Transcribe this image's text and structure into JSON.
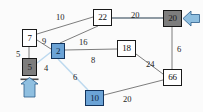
{
  "diagram": {
    "background_color": "#fbfbfb",
    "colors": {
      "node_white_fill": "#ffffff",
      "node_gray_fill": "#7d7d7d",
      "node_blue_fill": "#6ba3d6",
      "edge_default": "#6e6e6e",
      "edge_highlight": "#bcd9ef",
      "edge_thick": "#8e9aa3",
      "arrow_fill": "#8fbfe0",
      "arrow_stroke": "#2b5d8a",
      "text": "#1d1d1d"
    },
    "nodes": [
      {
        "id": "n7",
        "label": "7",
        "style": "white",
        "x": 22,
        "y": 29,
        "w": 15,
        "h": 18
      },
      {
        "id": "n5",
        "label": "5",
        "style": "gray",
        "x": 22,
        "y": 58,
        "w": 15,
        "h": 18
      },
      {
        "id": "n2",
        "label": "2",
        "style": "blue",
        "x": 51,
        "y": 43,
        "w": 14,
        "h": 16
      },
      {
        "id": "n22",
        "label": "22",
        "style": "white",
        "x": 93,
        "y": 9,
        "w": 19,
        "h": 17
      },
      {
        "id": "n20",
        "label": "20",
        "style": "gray",
        "x": 163,
        "y": 10,
        "w": 19,
        "h": 17
      },
      {
        "id": "n18",
        "label": "18",
        "style": "white",
        "x": 117,
        "y": 40,
        "w": 19,
        "h": 17
      },
      {
        "id": "n66",
        "label": "66",
        "style": "white",
        "x": 163,
        "y": 69,
        "w": 19,
        "h": 17
      },
      {
        "id": "n10",
        "label": "10",
        "style": "blue",
        "x": 85,
        "y": 90,
        "w": 19,
        "h": 16
      }
    ],
    "edges": [
      {
        "id": "e-7-22",
        "from": "n7",
        "to": "n22",
        "weight": "10",
        "style": "default",
        "label_x": 56,
        "label_y": 13
      },
      {
        "id": "e-7-2",
        "from": "n7",
        "to": "n2",
        "weight": "9",
        "style": "default",
        "label_x": 42,
        "label_y": 37
      },
      {
        "id": "e-2-22",
        "from": "n2",
        "to": "n22",
        "weight": "16",
        "style": "default",
        "label_x": 79,
        "label_y": 38
      },
      {
        "id": "e-22-20",
        "from": "n22",
        "to": "n20",
        "weight": "20",
        "style": "thick",
        "label_x": 131,
        "label_y": 11
      },
      {
        "id": "e-7-5",
        "from": "n7",
        "to": "n5",
        "weight": "5",
        "style": "default",
        "label_x": 16,
        "label_y": 50
      },
      {
        "id": "e-5-2",
        "from": "n5",
        "to": "n2",
        "weight": "4",
        "style": "highlight",
        "label_x": 44,
        "label_y": 64
      },
      {
        "id": "e-2-18",
        "from": "n2",
        "to": "n18",
        "weight": "8",
        "style": "default",
        "label_x": 91,
        "label_y": 56
      },
      {
        "id": "e-2-10",
        "from": "n2",
        "to": "n10",
        "weight": "6",
        "style": "highlight",
        "label_x": 73,
        "label_y": 73
      },
      {
        "id": "e-18-66",
        "from": "n18",
        "to": "n66",
        "weight": "24",
        "style": "default",
        "label_x": 146,
        "label_y": 60
      },
      {
        "id": "e-20-66",
        "from": "n20",
        "to": "n66",
        "weight": "6",
        "style": "default",
        "label_x": 177,
        "label_y": 45
      },
      {
        "id": "e-10-66",
        "from": "n10",
        "to": "n66",
        "weight": "20",
        "style": "default",
        "label_x": 123,
        "label_y": 95
      }
    ],
    "arrows": [
      {
        "id": "arrow-source-5",
        "target": "n5",
        "direction": "up",
        "x": 20,
        "y": 79,
        "w": 20,
        "h": 18
      },
      {
        "id": "arrow-sink-20",
        "target": "n20",
        "direction": "left",
        "x": 184,
        "y": 10,
        "w": 17,
        "h": 19
      }
    ]
  }
}
